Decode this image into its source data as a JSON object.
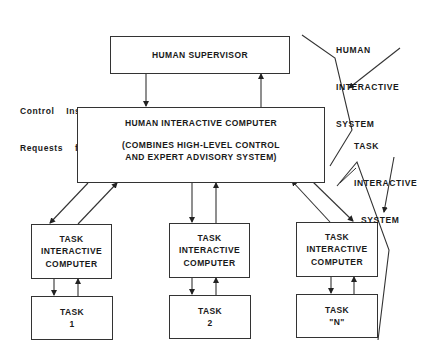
{
  "diagram": {
    "human_supervisor": {
      "label": "HUMAN SUPERVISOR"
    },
    "downlink_label": {
      "line1": "Control  Instructions,",
      "line2": "Requests  for  Advice"
    },
    "uplink_label": {
      "line1": "High-Level",
      "line2": "Feedback,  Advice"
    },
    "human_interactive_computer": {
      "title": "HUMAN INTERACTIVE COMPUTER",
      "sub1": "(COMBINES HIGH-LEVEL CONTROL",
      "sub2": "AND EXPERT ADVISORY SYSTEM)"
    },
    "task_interactive_computers": [
      {
        "l1": "TASK",
        "l2": "INTERACTIVE",
        "l3": "COMPUTER"
      },
      {
        "l1": "TASK",
        "l2": "INTERACTIVE",
        "l3": "COMPUTER"
      },
      {
        "l1": "TASK",
        "l2": "INTERACTIVE",
        "l3": "COMPUTER"
      }
    ],
    "tasks": [
      {
        "l1": "TASK",
        "l2": "1"
      },
      {
        "l1": "TASK",
        "l2": "2"
      },
      {
        "l1": "TASK",
        "l2": "\"N\""
      }
    ],
    "annotations": {
      "human_interactive_system": {
        "l1": "HUMAN",
        "l2": "INTERACTIVE",
        "l3": "SYSTEM"
      },
      "task_interactive_system": {
        "l1": "TASK",
        "l2": "INTERACTIVE",
        "l3": "SYSTEM"
      }
    },
    "line_color": "#333333"
  }
}
